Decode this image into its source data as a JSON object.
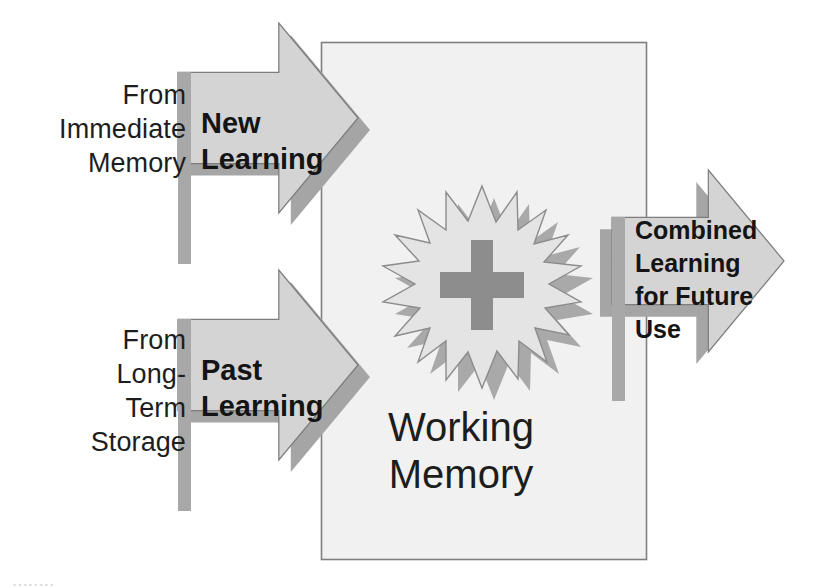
{
  "diagram": {
    "title": "Working Memory",
    "center": {
      "box_label": "Working\nMemory",
      "burst_symbol": "+",
      "burst_icon_name": "starburst-plus-icon"
    },
    "inputs": [
      {
        "source_label": "From\nImmediate\nMemory",
        "arrow_label": "New\nLearning"
      },
      {
        "source_label": "From\nLong-\nTerm\nStorage",
        "arrow_label": "Past\nLearning"
      }
    ],
    "output": {
      "arrow_label": "Combined\nLearning\nfor Future\nUse"
    },
    "bottom_cut_text": "........",
    "colors": {
      "arrow_fill": "#d4d4d4",
      "arrow_shadow": "#a8a8a8",
      "arrow_edge": "#8f8f8f",
      "box_fill": "#f1f1f1",
      "box_border": "#808080",
      "burst_fill": "#e3e3e3",
      "burst_shadow": "#a9a9a9",
      "plus_fill": "#8d8d8d",
      "text": "#1d1d1d",
      "page_background": "#ffffff"
    }
  }
}
